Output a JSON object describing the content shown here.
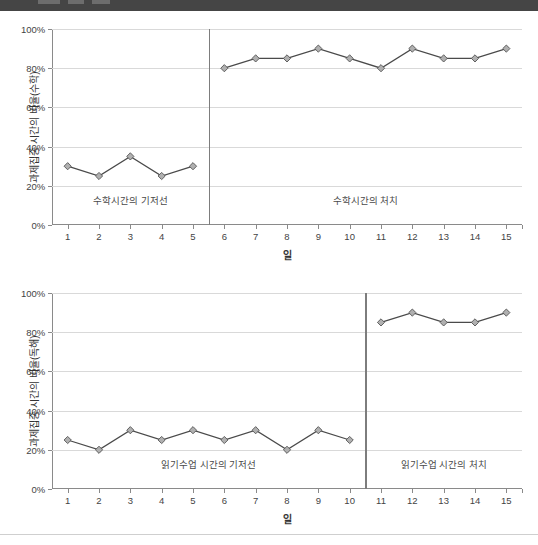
{
  "top_band": {
    "color": "#454545"
  },
  "charts": [
    {
      "id": "math",
      "ylabel": "과제집중 시간의 비율(수학)",
      "xlabel": "일",
      "ytick_labels": [
        "0%",
        "20%",
        "40%",
        "60%",
        "80%",
        "100%"
      ],
      "ytick_values": [
        0,
        20,
        40,
        60,
        80,
        100
      ],
      "xtick_labels": [
        "1",
        "2",
        "3",
        "4",
        "5",
        "6",
        "7",
        "8",
        "9",
        "10",
        "11",
        "12",
        "13",
        "14",
        "15"
      ],
      "phases": [
        {
          "label": "수학시간의 기저선",
          "start": 1,
          "end": 5
        },
        {
          "label": "수학시간의 처치",
          "start": 6,
          "end": 15
        }
      ],
      "separator_after_x": 5
    },
    {
      "id": "reading",
      "ylabel": "과제집중 시간의 비율(독해)",
      "xlabel": "일",
      "ytick_labels": [
        "0%",
        "20%",
        "40%",
        "60%",
        "80%",
        "100%"
      ],
      "ytick_values": [
        0,
        20,
        40,
        60,
        80,
        100
      ],
      "xtick_labels": [
        "1",
        "2",
        "3",
        "4",
        "5",
        "6",
        "7",
        "8",
        "9",
        "10",
        "11",
        "12",
        "13",
        "14",
        "15"
      ],
      "phases": [
        {
          "label": "읽기수업 시간의 기저선",
          "start": 1,
          "end": 10
        },
        {
          "label": "읽기수업 시간의 처치",
          "start": 11,
          "end": 15
        }
      ],
      "separator_after_x": 10
    }
  ],
  "chart_data": [
    {
      "type": "line",
      "title": "",
      "xlabel": "일",
      "ylabel": "과제집중 시간의 비율(수학)",
      "xlim": [
        0.5,
        15.5
      ],
      "ylim": [
        0,
        100
      ],
      "grid": true,
      "legend": "none",
      "marker": "diamond",
      "marker_fill": "#b0b0b0",
      "marker_edge": "#555555",
      "line_color": "#4a4a4a",
      "x": [
        1,
        2,
        3,
        4,
        5,
        6,
        7,
        8,
        9,
        10,
        11,
        12,
        13,
        14,
        15
      ],
      "series": [
        {
          "name": "기저선",
          "x": [
            1,
            2,
            3,
            4,
            5
          ],
          "values": [
            30,
            25,
            35,
            25,
            30
          ]
        },
        {
          "name": "처치",
          "x": [
            6,
            7,
            8,
            9,
            10,
            11,
            12,
            13,
            14,
            15
          ],
          "values": [
            80,
            85,
            85,
            90,
            85,
            80,
            90,
            85,
            85,
            90
          ]
        }
      ],
      "annotations": [
        "수학시간의 기저선",
        "수학시간의 처치"
      ]
    },
    {
      "type": "line",
      "title": "",
      "xlabel": "일",
      "ylabel": "과제집중 시간의 비율(독해)",
      "xlim": [
        0.5,
        15.5
      ],
      "ylim": [
        0,
        100
      ],
      "grid": true,
      "legend": "none",
      "marker": "diamond",
      "marker_fill": "#b0b0b0",
      "marker_edge": "#555555",
      "line_color": "#4a4a4a",
      "x": [
        1,
        2,
        3,
        4,
        5,
        6,
        7,
        8,
        9,
        10,
        11,
        12,
        13,
        14,
        15
      ],
      "series": [
        {
          "name": "기저선",
          "x": [
            1,
            2,
            3,
            4,
            5,
            6,
            7,
            8,
            9,
            10
          ],
          "values": [
            25,
            20,
            30,
            25,
            30,
            25,
            30,
            20,
            30,
            25
          ]
        },
        {
          "name": "처치",
          "x": [
            11,
            12,
            13,
            14,
            15
          ],
          "values": [
            85,
            90,
            85,
            85,
            90
          ]
        }
      ],
      "annotations": [
        "읽기수업 시간의 기저선",
        "읽기수업 시간의 처치"
      ]
    }
  ]
}
